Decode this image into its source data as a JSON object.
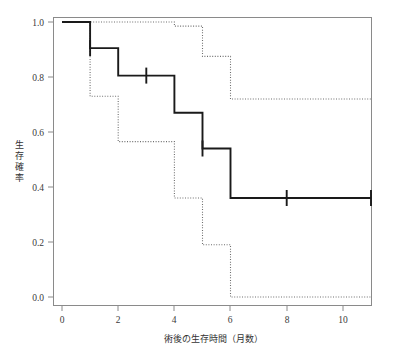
{
  "figure": {
    "kind": "kaplan-meier-survival-plot",
    "background_color": "#ffffff",
    "frame_color": "#7f7f7f",
    "curve_color": "#1a1a1a",
    "ci_color": "#6e6e6e"
  },
  "chart_data": {
    "type": "line",
    "title": "",
    "subtitle": "",
    "xlabel": "術後の生存時間（月数）",
    "ylabel": "生存確率",
    "xlim": [
      -0.35,
      11.6
    ],
    "ylim": [
      -0.04,
      1.04
    ],
    "xticks": [
      0,
      2,
      4,
      6,
      8,
      10
    ],
    "xtick_labels": [
      "0",
      "2",
      "4",
      "6",
      "8",
      "10"
    ],
    "yticks": [
      0.0,
      0.2,
      0.4,
      0.6,
      0.8,
      1.0
    ],
    "ytick_labels": [
      "0.0",
      "0.2",
      "0.4",
      "0.6",
      "0.8",
      "1.0"
    ],
    "grid": false,
    "legend": "none",
    "step_style": "post",
    "series": [
      {
        "name": "生存確率（Kaplan-Meier推定値）",
        "style": "solid",
        "color": "#1a1a1a",
        "x": [
          0,
          1,
          2,
          4,
          5,
          6,
          11
        ],
        "values": [
          1.0,
          0.905,
          0.805,
          0.67,
          0.54,
          0.36,
          0.36
        ]
      },
      {
        "name": "95%信頼区間 上限",
        "style": "dotted",
        "color": "#6e6e6e",
        "x": [
          0,
          1,
          2,
          4,
          5,
          6,
          11
        ],
        "values": [
          1.0,
          1.0,
          1.0,
          0.985,
          0.875,
          0.72,
          0.72
        ]
      },
      {
        "name": "95%信頼区間 下限",
        "style": "dotted",
        "color": "#6e6e6e",
        "x": [
          0,
          1,
          2,
          4,
          5,
          6,
          11
        ],
        "values": [
          1.0,
          0.73,
          0.565,
          0.36,
          0.19,
          0.0,
          0.0
        ]
      }
    ],
    "censored_marks": [
      {
        "x": 1,
        "y": 0.905
      },
      {
        "x": 3,
        "y": 0.805
      },
      {
        "x": 5,
        "y": 0.54
      },
      {
        "x": 8,
        "y": 0.36
      },
      {
        "x": 11,
        "y": 0.36
      }
    ],
    "annotations": []
  },
  "ylabel_chars": [
    "生",
    "存",
    "確",
    "率"
  ]
}
